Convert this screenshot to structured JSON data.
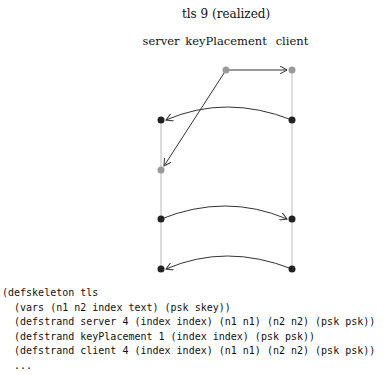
{
  "title": "tls 9 (realized)",
  "strands": [
    {
      "label": "server",
      "x": 161
    },
    {
      "label": "keyPlacement",
      "x": 226
    },
    {
      "label": "client",
      "x": 292
    }
  ],
  "nodes": [
    {
      "strand": "keyPlacement",
      "x": 226,
      "y": 70,
      "color": "#9a9a9a"
    },
    {
      "strand": "client",
      "x": 292,
      "y": 70,
      "color": "#9a9a9a"
    },
    {
      "strand": "server",
      "x": 161,
      "y": 120,
      "color": "#222222"
    },
    {
      "strand": "client",
      "x": 292,
      "y": 120,
      "color": "#222222"
    },
    {
      "strand": "server",
      "x": 161,
      "y": 170,
      "color": "#9a9a9a"
    },
    {
      "strand": "server",
      "x": 161,
      "y": 219,
      "color": "#222222"
    },
    {
      "strand": "client",
      "x": 292,
      "y": 219,
      "color": "#222222"
    },
    {
      "strand": "server",
      "x": 161,
      "y": 269,
      "color": "#222222"
    },
    {
      "strand": "client",
      "x": 292,
      "y": 269,
      "color": "#222222"
    }
  ],
  "code": {
    "lines": [
      "(defskeleton tls",
      "  (vars (n1 n2 index text) (psk skey))",
      "  (defstrand server 4 (index index) (n1 n1) (n2 n2) (psk psk))",
      "  (defstrand keyPlacement 1 (index index) (psk psk))",
      "  (defstrand client 4 (index index) (n1 n1) (n2 n2) (psk psk))",
      "  ..."
    ]
  }
}
